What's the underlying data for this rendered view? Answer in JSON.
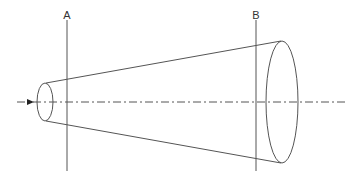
{
  "diagram": {
    "type": "conical-frustum-cross-sections",
    "labels": {
      "plane_a": "A",
      "plane_b": "B"
    },
    "elements": {
      "axis": {
        "style": "dash-dot",
        "direction": "left-to-right",
        "has_arrow": true
      },
      "small_end": {
        "shape": "ellipse"
      },
      "large_end": {
        "shape": "ellipse"
      },
      "plane_a": {
        "shape": "vertical-line",
        "label": "A"
      },
      "plane_b": {
        "shape": "vertical-line",
        "label": "B"
      }
    },
    "colors": {
      "stroke": "#555555",
      "background": "#ffffff"
    }
  }
}
